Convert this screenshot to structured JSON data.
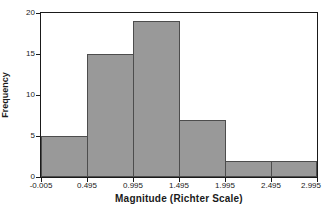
{
  "chart_data": {
    "type": "bar",
    "subtype": "histogram",
    "title": "",
    "xlabel": "Magnitude (Richter Scale)",
    "ylabel": "Frequency",
    "bin_edges": [
      -0.005,
      0.495,
      0.995,
      1.495,
      1.995,
      2.495,
      2.995
    ],
    "bin_width": 0.5,
    "values": [
      5,
      15,
      19,
      7,
      2,
      2
    ],
    "x_tick_labels": [
      "-0.005",
      "0.495",
      "0.995",
      "1.495",
      "1.995",
      "2.495",
      "2.995"
    ],
    "y_ticks": [
      0,
      5,
      10,
      15,
      20
    ],
    "y_tick_labels": [
      "0",
      "5",
      "10",
      "15",
      "20"
    ],
    "ylim": [
      0,
      20
    ],
    "grid": false,
    "legend": "none",
    "colors": {
      "bar_fill": "#999999",
      "bar_border": "#4d4d4d",
      "frame": "#1a1a1a",
      "text": "#1a1a1a",
      "background": "#ffffff"
    }
  }
}
